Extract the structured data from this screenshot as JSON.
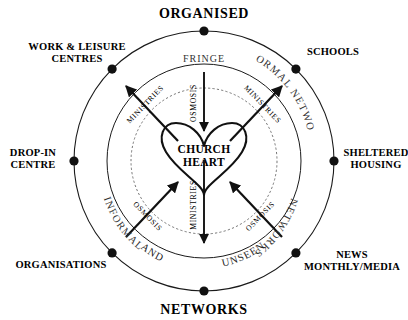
{
  "diagram": {
    "type": "concentric-circle-radial",
    "center_label": {
      "line1": "CHURCH",
      "line2": "HEART"
    },
    "cardinals": [
      {
        "name": "top",
        "text": "ORGANISED"
      },
      {
        "name": "bottom",
        "text": "NETWORKS"
      }
    ],
    "outer_nodes": [
      {
        "id": "organised",
        "angle_deg": 270,
        "lines": [
          "ORGANISED"
        ]
      },
      {
        "id": "schools",
        "angle_deg": 315,
        "lines": [
          "SCHOOLS"
        ]
      },
      {
        "id": "sheltered",
        "angle_deg": 0,
        "lines": [
          "SHELTERED",
          "HOUSING"
        ]
      },
      {
        "id": "news",
        "angle_deg": 45,
        "lines": [
          "NEWS",
          "MONTHLY/MEDIA"
        ]
      },
      {
        "id": "networks",
        "angle_deg": 90,
        "lines": [
          "NETWORKS"
        ]
      },
      {
        "id": "organisations",
        "angle_deg": 135,
        "lines": [
          "ORGANISATIONS"
        ]
      },
      {
        "id": "drop-in",
        "angle_deg": 180,
        "lines": [
          "DROP-IN",
          "CENTRE"
        ]
      },
      {
        "id": "work-leisure",
        "angle_deg": 225,
        "lines": [
          "WORK & LEISURE",
          "CENTRES"
        ]
      }
    ],
    "ring_labels": [
      {
        "id": "informal-networks",
        "text": "INFORMAL NETWORKS",
        "position": "upper-right"
      },
      {
        "id": "networks-ring",
        "text": "NETWORKS",
        "position": "lower-right"
      },
      {
        "id": "informal-ring",
        "text": "INFORMAL",
        "position": "lower-left"
      }
    ],
    "quadrant_labels": [
      {
        "id": "and",
        "text": "AND",
        "position": "bottom-left"
      },
      {
        "id": "unseen",
        "text": "UNSEEN",
        "position": "bottom-right"
      }
    ],
    "fringe_label": {
      "text": "FRINGE",
      "position": "top-inner"
    },
    "arrows": [
      {
        "id": "arrow-osmosis-top",
        "label": "OSMOSIS",
        "direction": "inward",
        "from": "top",
        "to": "heart"
      },
      {
        "id": "arrow-ministries-upper-left",
        "label": "MINISTRIES",
        "direction": "outward",
        "from": "heart",
        "to": "upper-left"
      },
      {
        "id": "arrow-ministries-upper-right",
        "label": "MINISTRIES",
        "direction": "outward",
        "from": "heart",
        "to": "upper-right"
      },
      {
        "id": "arrow-osmosis-lower-left",
        "label": "OSMOSIS",
        "direction": "inward",
        "from": "lower-left",
        "to": "heart"
      },
      {
        "id": "arrow-osmosis-lower-right",
        "label": "OSMOSIS",
        "direction": "inward",
        "from": "lower-right",
        "to": "heart"
      },
      {
        "id": "arrow-ministries-bottom",
        "label": "MINISTRIES",
        "direction": "outward",
        "from": "heart",
        "to": "bottom"
      }
    ],
    "colors": {
      "background": "#ffffff",
      "stroke": "#1a1a1a",
      "dashed_stroke": "#555555",
      "text": "#000000"
    }
  }
}
